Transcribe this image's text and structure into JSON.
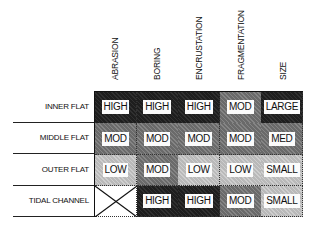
{
  "columns": [
    "ABRASION",
    "BORING",
    "ENCRUSTATION",
    "FRAGMENTATION",
    "SIZE"
  ],
  "rows": [
    {
      "label": "INNER FLAT",
      "values": [
        "HIGH",
        "HIGH",
        "HIGH",
        "MOD",
        "LARGE"
      ],
      "levels": [
        "high",
        "high",
        "high",
        "mod",
        "high"
      ]
    },
    {
      "label": "MIDDLE FLAT",
      "values": [
        "MOD",
        "MOD",
        "MOD",
        "MOD",
        "MED"
      ],
      "levels": [
        "mod",
        "mod",
        "mod",
        "mod",
        "mod"
      ]
    },
    {
      "label": "OUTER FLAT",
      "values": [
        "LOW",
        "MOD",
        "LOW",
        "LOW",
        "SMALL"
      ],
      "levels": [
        "low",
        "mod",
        "low",
        "low",
        "low"
      ]
    },
    {
      "label": "TIDAL CHANNEL",
      "values": [
        "",
        "HIGH",
        "HIGH",
        "MOD",
        "SMALL"
      ],
      "levels": [
        "none",
        "high",
        "high",
        "mod",
        "low"
      ]
    }
  ],
  "legend_colors": {
    "high": "#1e1e1e",
    "mod": "#6a6a6a",
    "low": "#b9b9b9",
    "none": "#ffffff"
  },
  "not_applicable_icon": "x-cross-icon"
}
